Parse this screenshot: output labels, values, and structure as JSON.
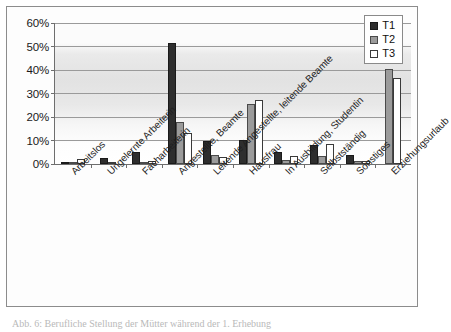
{
  "figure": {
    "caption": "Abb. 6: Berufliche Stellung der Mütter während der 1. Erhebung",
    "legend_title": ""
  },
  "legend": {
    "position": "top-right",
    "entries": [
      {
        "label": "T1",
        "color": "#2e2e2e"
      },
      {
        "label": "T2",
        "color": "#9b9b9b"
      },
      {
        "label": "T3",
        "color": "#ffffff"
      }
    ]
  },
  "axis": {
    "y_ticks": [
      "0%",
      "10%",
      "20%",
      "30%",
      "40%",
      "50%",
      "60%"
    ],
    "y_min": 0,
    "y_max": 60,
    "y_step": 10
  },
  "chart_data": {
    "type": "bar",
    "title": "",
    "xlabel": "",
    "ylabel": "",
    "ylim": [
      0,
      60
    ],
    "grid": true,
    "legend_position": "top-right",
    "categories": [
      "Arbeitslos",
      "Ungelernte Arbeiterin",
      "Facharbeiterin",
      "Angestellte, Beamte",
      "Leitende Angestellte, leitende Beamte",
      "Hausfrau",
      "In Ausbildung, Studentin",
      "Selbstständig",
      "Sonstiges",
      "Erziehungsurlaub"
    ],
    "series": [
      {
        "name": "T1",
        "color": "#2e2e2e",
        "values": [
          1.0,
          2.7,
          5.2,
          51.3,
          9.6,
          10.1,
          5.1,
          8.0,
          4.0,
          0
        ]
      },
      {
        "name": "T2",
        "color": "#9b9b9b",
        "values": [
          1.0,
          0,
          0.9,
          17.7,
          4.0,
          25.5,
          1.7,
          3.3,
          1.4,
          40.5
        ]
      },
      {
        "name": "T3",
        "color": "#ffffff",
        "values": [
          2.0,
          0.5,
          1.3,
          13.0,
          3.0,
          27.2,
          3.2,
          8.5,
          1.1,
          36.5
        ]
      }
    ]
  }
}
